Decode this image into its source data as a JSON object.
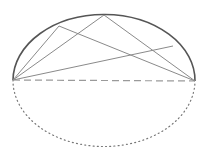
{
  "diagram": {
    "colors": {
      "background": "#ffffff",
      "arc_upper": "#555555",
      "chords": "#8a8a8a",
      "diameter": "#9a9a9a",
      "arc_lower": "#777777"
    },
    "points": {
      "A": [
        13,
        80
      ],
      "B": [
        195,
        81
      ],
      "T": [
        104,
        15
      ],
      "P": [
        59,
        26
      ],
      "Q": [
        173,
        46
      ]
    },
    "upper_arc": {
      "style": "solid",
      "from": "A",
      "to": "B",
      "ry": 66
    },
    "lower_arc": {
      "style": "dotted",
      "from": "A",
      "to": "B",
      "ry": 66
    },
    "diameter": {
      "style": "dashed",
      "from": "A",
      "to": "B"
    },
    "chords": [
      {
        "from": "A",
        "to": "T"
      },
      {
        "from": "A",
        "to": "P"
      },
      {
        "from": "A",
        "to": "Q"
      },
      {
        "from": "P",
        "to": "B"
      },
      {
        "from": "T",
        "to": "B"
      }
    ]
  }
}
